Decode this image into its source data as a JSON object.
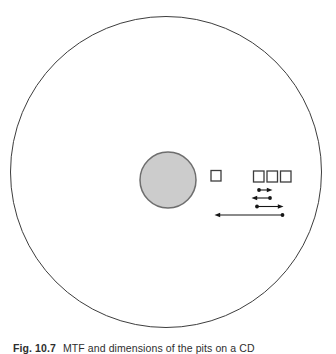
{
  "figure": {
    "type": "schematic-diagram",
    "caption": {
      "label": "Fig. 10.7",
      "text": "MTF and dimensions of the pits on a CD"
    },
    "colors": {
      "background": "#ffffff",
      "disc_stroke": "#3d3d3d",
      "hub_fill": "#cccccc",
      "hub_stroke": "#6e6e6e",
      "pit_stroke": "#3d3d3d",
      "pit_fill": "#ffffff",
      "arrow": "#161616",
      "caption_text": "#2e2e2e"
    },
    "elements": {
      "disc": "outer disc outline circle",
      "hub": "shaded center hub circle",
      "isolated_pit_count": 1,
      "pit_group_count": 3,
      "arrow_rows": [
        {
          "row": 1,
          "direction": "right",
          "dot_end": "left",
          "length": "short"
        },
        {
          "row": 2,
          "direction": "left",
          "dot_end": "right",
          "length": "short"
        },
        {
          "row": 3,
          "direction": "right",
          "dot_end": "left",
          "length": "medium"
        },
        {
          "row": 4,
          "direction": "left",
          "dot_end": "right",
          "length": "long"
        }
      ]
    }
  }
}
